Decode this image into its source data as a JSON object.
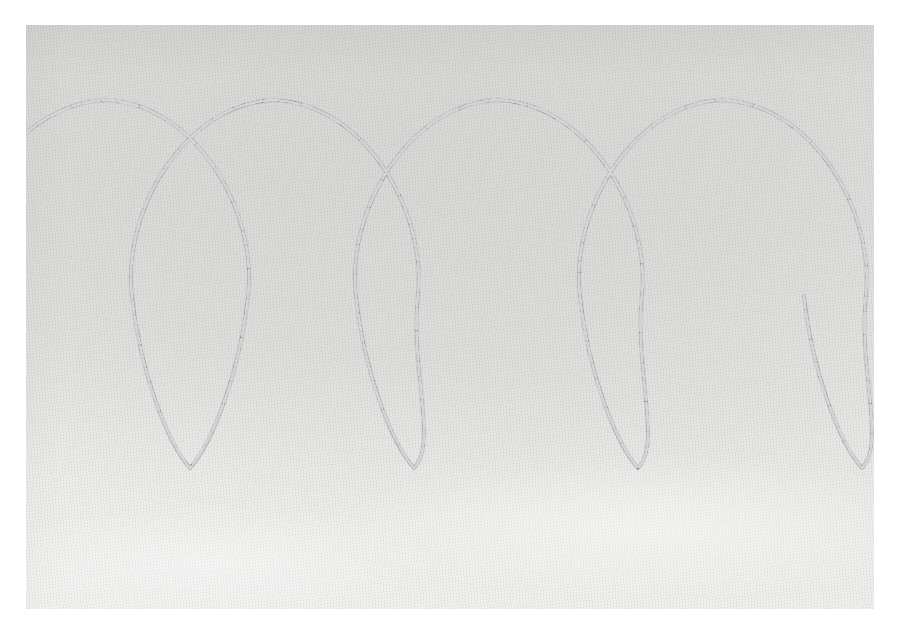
{
  "image": {
    "subject": "Hand-stitched running-stitch quilting pattern on plain woven cloth",
    "medium": "photograph",
    "title": "Stitched teardrop-lobe chain on light grey fabric",
    "width_px": 900,
    "height_px": 624
  },
  "page": {
    "background_color": "#ffffff",
    "margin_left_px": 26,
    "margin_top_px": 25,
    "margin_right_px": 26,
    "margin_bottom_px": 15
  },
  "fabric": {
    "name": "woven-cloth-swatch",
    "base_color": "#e2e2e0",
    "highlight_color": "#f3f3f2",
    "shadow_color": "#d6d6d4",
    "weave": "plain-weave-fine-twill",
    "left_px": 26,
    "top_px": 25,
    "width_px": 848,
    "height_px": 584
  },
  "stitching": {
    "name": "running-stitch-line",
    "thread_color": "#3a3a3c",
    "stitch_style": "running stitch",
    "stroke_width_px": 2.6,
    "dash_pattern": "13 2.2 21 2.6 9 1.8 17 2.4",
    "description": "A single continuous serpentine line that alternates between an upward teardrop lobe and a downward teardrop lobe, pinching to a narrow neck where consecutive lobes meet."
  },
  "pattern": {
    "motif": "alternating teardrop lobes (pumpkin-seed / figure-eight chain)",
    "period_px": 224,
    "upper_lobe_apex_y_px": 100,
    "lower_lobe_apex_y_px": 468,
    "neck_y_px": 288,
    "upper_apex_x_px": [
      105,
      330,
      552,
      776
    ],
    "lower_apex_x_px": [
      -35,
      190,
      414,
      638,
      862
    ],
    "lobe_count_visible": 9,
    "upper_lobe_count": 4,
    "lower_lobe_count": 5,
    "lobe_max_width_px": 190
  },
  "chart_data": {
    "type": "line",
    "title": "Stitched teardrop-lobe chain on light grey fabric",
    "xlabel": "",
    "ylabel": "",
    "xlim": [
      26,
      874
    ],
    "ylim": [
      25,
      609
    ],
    "grid": false,
    "legend": "none",
    "series": [
      {
        "name": "running-stitch-contour",
        "color": "#3a3a3c",
        "path_commands": "M -60 300 C -48 212 14 104 106 100 C 198 104 258 214 248 296 C 240 372 212 444 190 468 C 168 444 140 372 132 296 C 122 214 182 104 274 100 C 366 104 426 212 418 294 C 410 370 438 444 414 468 C 392 444 364 372 356 296 C 346 214 406 104 498 100 C 590 104 650 212 642 294 C 634 370 662 444 638 468 C 616 444 588 372 580 296 C 570 214 630 104 722 100 C 814 104 874 212 866 294 C 858 370 886 444 862 468 C 840 444 812 372 804 296"
      }
    ]
  },
  "colors": {
    "page_white": "#ffffff",
    "fabric_light": "#f3f3f2",
    "fabric_mid": "#e2e2e0",
    "thread_dark": "#3a3a3c"
  }
}
